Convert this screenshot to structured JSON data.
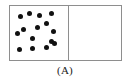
{
  "figure": {
    "caption": "(A)"
  },
  "colors": {
    "border": "#8e8e8e",
    "particle": "#111111",
    "background": "#ffffff",
    "caption_text": "#1a1a1a"
  },
  "container": {
    "left": 9,
    "top": 5,
    "width": 113,
    "height": 56,
    "border_width": 1
  },
  "partition": {
    "label": "partition",
    "x": 58,
    "width": 1,
    "height": 54
  },
  "chambers": [
    {
      "name": "left-chamber",
      "state": "filled",
      "contents": "gas particles",
      "particle_count": 15
    },
    {
      "name": "right-chamber",
      "state": "empty",
      "contents": "vacuum",
      "particle_count": 0
    }
  ],
  "particles": [
    {
      "x": 10,
      "y": 10,
      "r": 2.5
    },
    {
      "x": 19,
      "y": 7,
      "r": 2.5
    },
    {
      "x": 29,
      "y": 9,
      "r": 2.5
    },
    {
      "x": 41,
      "y": 7,
      "r": 2.5
    },
    {
      "x": 13,
      "y": 23,
      "r": 2.5
    },
    {
      "x": 27,
      "y": 21,
      "r": 2.5
    },
    {
      "x": 36,
      "y": 17,
      "r": 2.5
    },
    {
      "x": 43,
      "y": 25,
      "r": 2.5
    },
    {
      "x": 7,
      "y": 27,
      "r": 2.5
    },
    {
      "x": 22,
      "y": 32,
      "r": 2.5
    },
    {
      "x": 41,
      "y": 35,
      "r": 2.5
    },
    {
      "x": 9,
      "y": 43,
      "r": 2.5
    },
    {
      "x": 22,
      "y": 42,
      "r": 2.5
    },
    {
      "x": 36,
      "y": 41,
      "r": 2.5
    },
    {
      "x": 44,
      "y": 37,
      "r": 2.5
    }
  ]
}
